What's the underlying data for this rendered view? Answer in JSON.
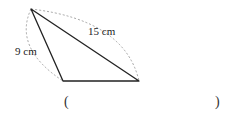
{
  "diagram": {
    "shape": "triangle",
    "vertices": {
      "top": [
        31,
        9
      ],
      "bottom_left": [
        63,
        81
      ],
      "bottom_right": [
        139,
        81
      ]
    },
    "labels": {
      "left_side": "9 cm",
      "hypotenuse": "15 cm"
    },
    "answer": {
      "open_paren": "(",
      "close_paren": ")",
      "value": ""
    },
    "colors": {
      "line": "#222222",
      "dashed": "#999999"
    }
  }
}
